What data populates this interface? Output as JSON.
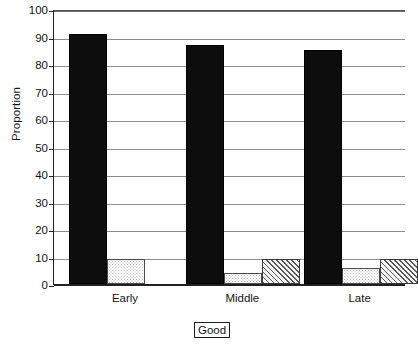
{
  "chart_data": {
    "type": "bar",
    "title": "",
    "subtitle": "",
    "xlabel": "",
    "ylabel": "Proportion",
    "categories": [
      "Early",
      "Middle",
      "Late"
    ],
    "ylim": [
      0,
      100
    ],
    "yticks": [
      0,
      10,
      20,
      30,
      40,
      50,
      60,
      70,
      80,
      90,
      100
    ],
    "ytick_labels": [
      "0",
      "10",
      "20",
      "30",
      "40",
      "50",
      "60",
      "70",
      "80",
      "90",
      "100"
    ],
    "grid": true,
    "grid_axis": "y",
    "legend": false,
    "legend_position": "none",
    "series": [
      {
        "name": "series-1",
        "fill": "solid-black",
        "color": "#0d0d0d",
        "values": [
          91,
          87,
          85
        ]
      },
      {
        "name": "series-2",
        "fill": "fine-dotted",
        "color": "#fefefe",
        "values": [
          9,
          4,
          6
        ]
      },
      {
        "name": "series-3",
        "fill": "diagonal-hatch",
        "color": "#f4f4f4",
        "values": [
          null,
          9,
          9
        ]
      }
    ],
    "annotations": [
      {
        "text": "Good",
        "style": "boxed-shadow",
        "position": "below-x-axis-center"
      }
    ]
  },
  "axis": {
    "y_title": "Proportion"
  },
  "annotation": {
    "good_label": "Good"
  },
  "colors": {
    "solid_bar": "#0d0d0d",
    "dotted_bar": "#fefefe",
    "hatched_bar": "#f4f4f4",
    "gridline": "#8c8c8c",
    "axis": "#222222",
    "text": "#141414",
    "background": "#ffffff"
  }
}
